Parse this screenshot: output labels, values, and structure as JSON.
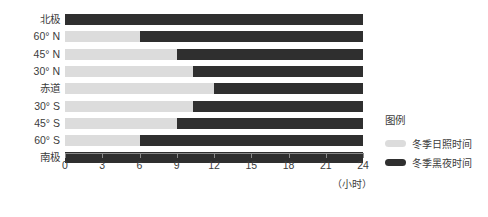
{
  "chart_data": {
    "type": "bar",
    "orientation": "horizontal",
    "stacked": true,
    "title": "",
    "xlabel": "（小时）",
    "ylabel": "",
    "xlim": [
      0,
      24
    ],
    "xticks": [
      0,
      3,
      6,
      9,
      12,
      15,
      18,
      21,
      24
    ],
    "xtick_labels": [
      "0",
      "3",
      "6",
      "9",
      "12",
      "15",
      "18",
      "21",
      "24"
    ],
    "grid": false,
    "categories": [
      "北极",
      "60° N",
      "45° N",
      "30° N",
      "赤道",
      "30° S",
      "45° S",
      "60° S",
      "南极"
    ],
    "series": [
      {
        "name": "冬季日照时间",
        "color": "#dcdcdc",
        "values": [
          0,
          6,
          9,
          10.3,
          12,
          10.3,
          9,
          6,
          0
        ]
      },
      {
        "name": "冬季黑夜时间",
        "color": "#2f2f2f",
        "values": [
          24,
          18,
          15,
          13.7,
          12,
          13.7,
          15,
          18,
          24
        ]
      }
    ],
    "legend": {
      "title": "图例",
      "position": "right",
      "entries": [
        {
          "label": "冬季日照时间",
          "color": "#dcdcdc"
        },
        {
          "label": "冬季黑夜时间",
          "color": "#2f2f2f"
        }
      ]
    }
  },
  "colors": {
    "background": "#ffffff",
    "daylight": "#dcdcdc",
    "night": "#2f2f2f",
    "axis": "#8a8a8a",
    "text": "#3c3c3c"
  }
}
